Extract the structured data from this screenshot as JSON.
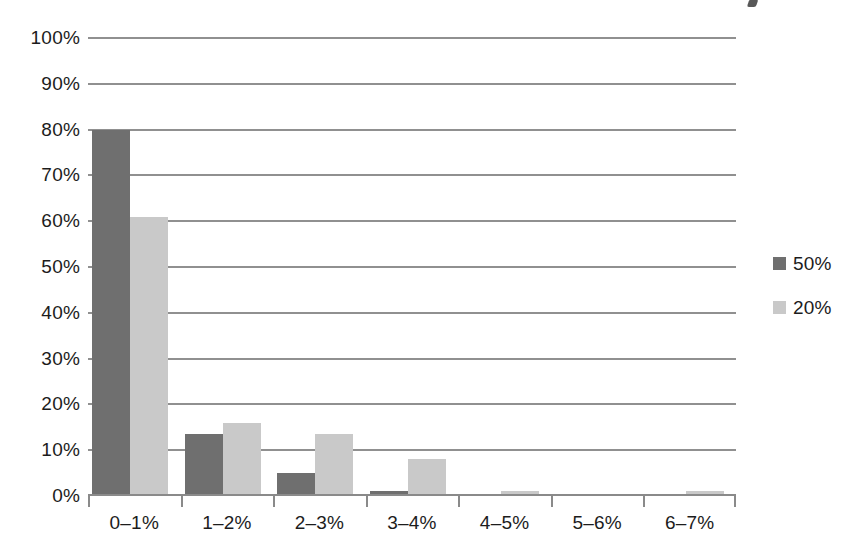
{
  "chart_data": {
    "type": "bar",
    "title": "",
    "xlabel": "",
    "ylabel": "",
    "ylim": [
      0,
      100
    ],
    "ytick_labels": [
      "100%",
      "90%",
      "80%",
      "70%",
      "60%",
      "50%",
      "40%",
      "30%",
      "20%",
      "10%",
      "0%"
    ],
    "ytick_values": [
      100,
      90,
      80,
      70,
      60,
      50,
      40,
      30,
      20,
      10,
      0
    ],
    "grid": true,
    "grid_axis": "y",
    "legend_position": "right",
    "categories": [
      "0–1%",
      "1–2%",
      "2–3%",
      "3–4%",
      "4–5%",
      "5–6%",
      "6–7%"
    ],
    "series": [
      {
        "name": "50%",
        "color": "#6f6f6f",
        "values": [
          80,
          13.5,
          5,
          1,
          0,
          0,
          0
        ]
      },
      {
        "name": "20%",
        "color": "#c9c9c9",
        "values": [
          61,
          16,
          13.5,
          8,
          1,
          0.2,
          1.2
        ]
      }
    ]
  },
  "legend": {
    "items": [
      {
        "label": "50%",
        "color": "#6f6f6f"
      },
      {
        "label": "20%",
        "color": "#c9c9c9"
      }
    ]
  },
  "axis": {
    "y_labels": [
      "100%",
      "90%",
      "80%",
      "70%",
      "60%",
      "50%",
      "40%",
      "30%",
      "20%",
      "10%",
      "0%"
    ],
    "x_labels": [
      "0–1%",
      "1–2%",
      "2–3%",
      "3–4%",
      "4–5%",
      "5–6%",
      "6–7%"
    ]
  },
  "colors": {
    "series_dark": "#6f6f6f",
    "series_light": "#c9c9c9",
    "gridline": "#909090",
    "axis": "#8a8a8a",
    "text": "#1c1c1c",
    "background": "#ffffff"
  }
}
